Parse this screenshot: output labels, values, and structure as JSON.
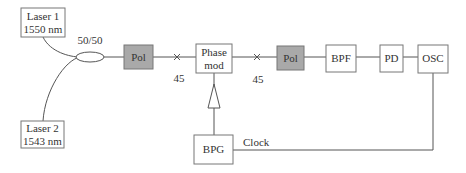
{
  "diagram": {
    "components": {
      "laser1": {
        "line1": "Laser 1",
        "line2": "1550 nm"
      },
      "laser2": {
        "line1": "Laser 2",
        "line2": "1543 nm"
      },
      "coupler": {
        "label": "50/50"
      },
      "pol1": {
        "label": "Pol"
      },
      "phase_mod": {
        "line1": "Phase",
        "line2": "mod"
      },
      "pol2": {
        "label": "Pol"
      },
      "bpf": {
        "label": "BPF"
      },
      "pd": {
        "label": "PD"
      },
      "osc": {
        "label": "OSC"
      },
      "bpg": {
        "label": "BPG"
      }
    },
    "splice_labels": {
      "first": "45",
      "second": "45"
    },
    "clock_label": "Clock",
    "colors": {
      "line": "#555555",
      "box_border": "#777777",
      "pol_fill": "#a9a9a9",
      "text": "#333333"
    }
  }
}
